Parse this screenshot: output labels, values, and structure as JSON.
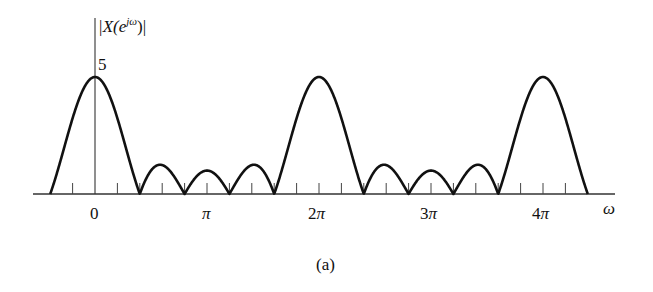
{
  "chart_data": {
    "type": "line",
    "title": "",
    "ylabel": "|X(e^{jω})|",
    "ylabel_parts": {
      "pre": "|X(e",
      "sup": "jω",
      "post": ")|"
    },
    "xlabel": "ω",
    "caption": "(a)",
    "y_tick_label": "5",
    "y_peak_value": 5,
    "x_tick_labels": [
      {
        "label": "0",
        "omega_over_pi": 0
      },
      {
        "label": "π",
        "omega_over_pi": 1
      },
      {
        "label": "2π",
        "omega_over_pi": 2
      },
      {
        "label": "3π",
        "omega_over_pi": 3
      },
      {
        "label": "4π",
        "omega_over_pi": 4
      }
    ],
    "formula": "|sin(5ω/2) / sin(ω/2)|",
    "N": 5,
    "x_range_over_pi": [
      -0.4,
      4.4
    ],
    "minor_tick_step_over_pi": 0.2,
    "zeros_over_pi": [
      -0.4,
      0.4,
      0.8,
      1.2,
      1.6,
      2.4,
      2.8,
      3.2,
      3.6,
      4.4
    ],
    "main_lobe_peaks": [
      {
        "x_over_pi": 0,
        "y": 5
      },
      {
        "x_over_pi": 2,
        "y": 5
      },
      {
        "x_over_pi": 4,
        "y": 5
      }
    ],
    "side_lobe_peaks": [
      {
        "x_over_pi": 0.6,
        "y": 1.24
      },
      {
        "x_over_pi": 1.0,
        "y": 1.0
      },
      {
        "x_over_pi": 1.4,
        "y": 1.24
      },
      {
        "x_over_pi": 2.6,
        "y": 1.24
      },
      {
        "x_over_pi": 3.0,
        "y": 1.0
      },
      {
        "x_over_pi": 3.4,
        "y": 1.24
      }
    ],
    "grid": false,
    "legend": null
  },
  "colors": {
    "curve": "#111111",
    "axis": "#333333",
    "background": "#ffffff"
  }
}
